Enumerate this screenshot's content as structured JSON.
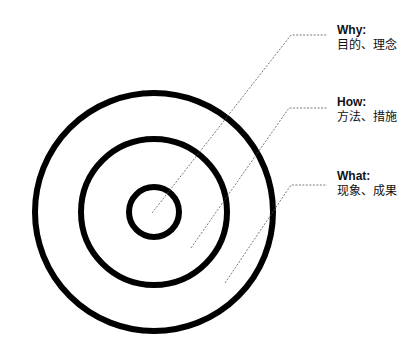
{
  "diagram": {
    "type": "golden-circle",
    "center": [
      154,
      212
    ],
    "circles": [
      {
        "name": "outer",
        "radius": 119,
        "stroke": 6
      },
      {
        "name": "middle",
        "radius": 73,
        "stroke": 6
      },
      {
        "name": "inner",
        "radius": 25,
        "stroke": 6
      }
    ],
    "colors": {
      "stroke": "#000000",
      "leader": "#555555",
      "background": "#ffffff"
    },
    "labels": [
      {
        "key": "why",
        "title": "Why:",
        "desc": "目的、理念"
      },
      {
        "key": "how",
        "title": "How:",
        "desc": "方法、措施"
      },
      {
        "key": "what",
        "title": "What:",
        "desc": "现象、成果"
      }
    ]
  }
}
